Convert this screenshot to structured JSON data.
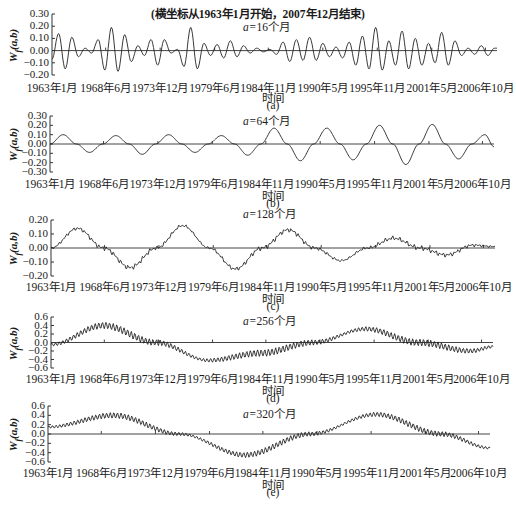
{
  "figure": {
    "note": "(横坐标从1963年1月开始，2007年12月结束)",
    "x_axis_label": "时间",
    "y_axis_label": "W_f(a,b)",
    "x_ticks": [
      "1963年1月",
      "1968年6月",
      "1973年12月",
      "1979年6月",
      "1984年11月",
      "1990年5月",
      "1995年11月",
      "2001年5月",
      "2006年10月"
    ]
  },
  "chart_data": [
    {
      "type": "line",
      "panel": "(a)",
      "title": "a=16个月",
      "scale_prefix": "a=",
      "scale_value": "16个月",
      "xlabel": "时间",
      "ylabel": "Wf(a,b)",
      "x_start": "1963年1月",
      "x_end": "2007年12月",
      "categories": [
        "1963年1月",
        "1968年6月",
        "1973年12月",
        "1979年6月",
        "1984年11月",
        "1990年5月",
        "1995年11月",
        "2001年5月",
        "2006年10月"
      ],
      "yticks": [
        "0.30",
        "0.20",
        "0.10",
        "0.00",
        "-0.10",
        "-0.20"
      ],
      "ylim": [
        -0.2,
        0.3
      ],
      "period_months": 16,
      "x_months": [
        0,
        8,
        16,
        24,
        32,
        40,
        48,
        56,
        64,
        72,
        80,
        88,
        96,
        104,
        112,
        120,
        128,
        136,
        144,
        152,
        160,
        168,
        176,
        184,
        192,
        200,
        208,
        216,
        224,
        232,
        240,
        248,
        256,
        264,
        272,
        280,
        288,
        296,
        304,
        312,
        320,
        328,
        336,
        344,
        352,
        360,
        368,
        376,
        384,
        392,
        400,
        408,
        416,
        424,
        432,
        440,
        448,
        456,
        464,
        472,
        480,
        488,
        496,
        504,
        512,
        520,
        528,
        536
      ],
      "values": [
        -0.07,
        0.14,
        -0.15,
        0.11,
        -0.05,
        0.02,
        -0.02,
        0.09,
        -0.16,
        0.19,
        -0.17,
        0.13,
        -0.09,
        0.04,
        -0.04,
        0.09,
        -0.12,
        0.09,
        -0.02,
        0.01,
        -0.13,
        0.19,
        -0.15,
        0.06,
        -0.04,
        0.05,
        -0.06,
        0.08,
        -0.05,
        0.04,
        -0.02,
        0.02,
        -0.01,
        0.01,
        -0.03,
        0.07,
        -0.09,
        0.09,
        -0.08,
        0.11,
        -0.08,
        0.06,
        -0.05,
        0.03,
        -0.06,
        0.07,
        -0.12,
        0.12,
        -0.15,
        0.19,
        -0.16,
        0.08,
        -0.12,
        0.16,
        -0.15,
        0.1,
        -0.12,
        0.06,
        -0.1,
        0.15,
        -0.12,
        0.08,
        -0.04,
        0.02,
        -0.03,
        0.04,
        -0.04,
        0.02
      ]
    },
    {
      "type": "line",
      "panel": "(b)",
      "title": "a=64个月",
      "scale_prefix": "a=",
      "scale_value": "64个月",
      "xlabel": "时间",
      "ylabel": "Wf(a,b)",
      "categories": [
        "1963年1月",
        "1968年6月",
        "1973年12月",
        "1979年6月",
        "1984年11月",
        "1990年5月",
        "1995年11月",
        "2001年5月",
        "2006年10月"
      ],
      "yticks": [
        "0.30",
        "0.20",
        "0.10",
        "0.00",
        "-0.10",
        "-0.20",
        "-0.30"
      ],
      "ylim": [
        -0.3,
        0.3
      ],
      "period_months": 64,
      "x_months": [
        0,
        16,
        32,
        48,
        64,
        80,
        96,
        112,
        128,
        144,
        160,
        176,
        192,
        208,
        224,
        240,
        256,
        272,
        288,
        304,
        320,
        336,
        352,
        368,
        384,
        400,
        416,
        432,
        448,
        464,
        480,
        496,
        512,
        528,
        539
      ],
      "values": [
        0.0,
        0.1,
        0.0,
        -0.09,
        0.0,
        0.09,
        0.0,
        -0.11,
        0.0,
        0.1,
        0.0,
        -0.09,
        0.0,
        0.09,
        0.0,
        -0.12,
        0.0,
        0.17,
        0.0,
        -0.18,
        0.0,
        0.17,
        0.0,
        -0.17,
        0.0,
        0.2,
        0.0,
        -0.22,
        0.0,
        0.21,
        0.0,
        -0.16,
        0.0,
        0.1,
        -0.03
      ]
    },
    {
      "type": "line",
      "panel": "(c)",
      "title": "a=128个月",
      "scale_prefix": "a=",
      "scale_value": "128个月",
      "xlabel": "时间",
      "ylabel": "Wf(a,b)",
      "categories": [
        "1963年1月",
        "1968年6月",
        "1973年12月",
        "1979年6月",
        "1984年11月",
        "1990年5月",
        "1995年11月",
        "2001年5月",
        "2006年10月"
      ],
      "yticks": [
        "0.20",
        "0.10",
        "0.00",
        "-0.10",
        "-0.20"
      ],
      "ylim": [
        -0.2,
        0.2
      ],
      "period_months": 128,
      "x_months": [
        0,
        32,
        64,
        96,
        128,
        160,
        192,
        224,
        256,
        288,
        320,
        352,
        384,
        416,
        448,
        480,
        512,
        539
      ],
      "values": [
        0.0,
        0.14,
        0.0,
        -0.14,
        0.0,
        0.16,
        0.0,
        -0.15,
        0.0,
        0.13,
        0.0,
        -0.09,
        0.0,
        0.07,
        0.0,
        -0.05,
        0.02,
        0.01
      ],
      "noise_amplitude": 0.02
    },
    {
      "type": "line",
      "panel": "(d)",
      "title": "a=256个月",
      "scale_prefix": "a=",
      "scale_value": "256个月",
      "xlabel": "时间",
      "ylabel": "Wf(a,b)",
      "categories": [
        "1963年1月",
        "1968年6月",
        "1973年12月",
        "1979年6月",
        "1984年11月",
        "1990年5月",
        "1995年11月",
        "2001年5月",
        "2006年10月"
      ],
      "yticks": [
        "0.6",
        "0.4",
        "0.2",
        "0.0",
        "-0.2",
        "-0.4",
        "-0.6"
      ],
      "ylim": [
        -0.6,
        0.6
      ],
      "period_months": 256,
      "x_months": [
        0,
        64,
        128,
        192,
        256,
        320,
        384,
        448,
        512,
        539
      ],
      "values": [
        -0.05,
        0.4,
        0.0,
        -0.42,
        -0.25,
        0.0,
        0.32,
        0.0,
        -0.2,
        -0.1
      ],
      "noise_amplitude": 0.08
    },
    {
      "type": "line",
      "panel": "(e)",
      "title": "a=320个月",
      "scale_prefix": "a=",
      "scale_value": "320个月",
      "xlabel": "时间",
      "ylabel": "Wf(a,b)",
      "categories": [
        "1963年1月",
        "1968年6月",
        "1973年12月",
        "1979年6月",
        "1984年11月",
        "1990年5月",
        "1995年11月",
        "2001年5月",
        "2006年10月"
      ],
      "yticks": [
        "0.6",
        "0.4",
        "0.2",
        "0.0",
        "-0.2",
        "-0.4",
        "-0.6"
      ],
      "ylim": [
        -0.6,
        0.6
      ],
      "period_months": 320,
      "x_months": [
        0,
        80,
        160,
        240,
        320,
        400,
        480,
        539
      ],
      "values": [
        0.15,
        0.4,
        0.0,
        -0.45,
        0.0,
        0.42,
        0.0,
        -0.3
      ],
      "noise_amplitude": 0.06
    }
  ]
}
